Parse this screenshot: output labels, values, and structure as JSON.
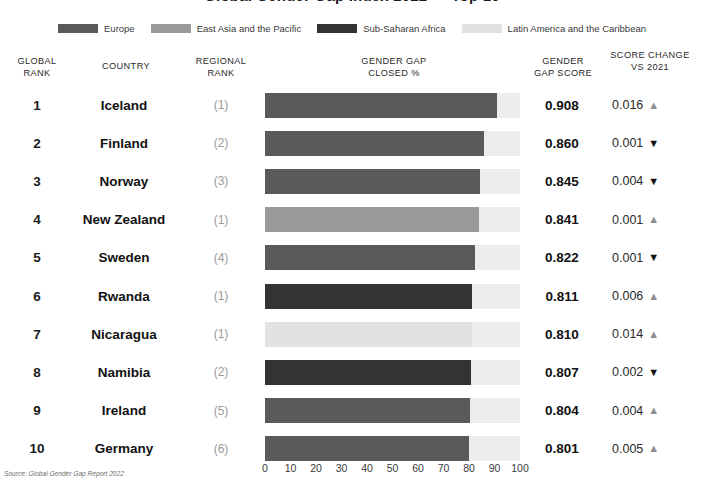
{
  "title": "Global Gender Gap Index 2022 — Top 10",
  "legend": {
    "items": [
      {
        "label": "Europe",
        "color": "#5a5a5a",
        "key": "europe"
      },
      {
        "label": "East Asia and the Pacific",
        "color": "#9a9a9a",
        "key": "east-asia-pacific"
      },
      {
        "label": "Sub-Saharan Africa",
        "color": "#333333",
        "key": "sub-saharan-africa"
      },
      {
        "label": "Latin America and the Caribbean",
        "color": "#e2e2e2",
        "key": "latin-america-caribbean"
      }
    ]
  },
  "headers": {
    "global_rank": "GLOBAL\nRANK",
    "global_rank_l1": "GLOBAL",
    "global_rank_l2": "RANK",
    "country": "COUNTRY",
    "regional_rank_l1": "REGIONAL",
    "regional_rank_l2": "RANK",
    "gender_gap_l1": "GENDER GAP",
    "gender_gap_l2": "CLOSED %",
    "gender_gap_score_l1": "GENDER",
    "gender_gap_score_l2": "GAP SCORE",
    "score_change_l1": "SCORE CHANGE",
    "score_change_l2": "VS 2021"
  },
  "axis": {
    "ticks": [
      "0",
      "10",
      "20",
      "30",
      "40",
      "50",
      "60",
      "70",
      "80",
      "90",
      "100"
    ],
    "min": 0,
    "max": 100
  },
  "source": "Source: Global Gender Gap Report 2022",
  "track_color": "#ececec",
  "rows": [
    {
      "rank": "1",
      "country": "Iceland",
      "regional_rank": "(1)",
      "score": "0.908",
      "pct": 90.8,
      "region": "europe",
      "bar_color": "#5a5a5a",
      "change": "0.016",
      "direction": "up",
      "arrow": "▲"
    },
    {
      "rank": "2",
      "country": "Finland",
      "regional_rank": "(2)",
      "score": "0.860",
      "pct": 86.0,
      "region": "europe",
      "bar_color": "#5a5a5a",
      "change": "0.001",
      "direction": "down",
      "arrow": "▼"
    },
    {
      "rank": "3",
      "country": "Norway",
      "regional_rank": "(3)",
      "score": "0.845",
      "pct": 84.5,
      "region": "europe",
      "bar_color": "#5a5a5a",
      "change": "0.004",
      "direction": "down",
      "arrow": "▼"
    },
    {
      "rank": "4",
      "country": "New Zealand",
      "regional_rank": "(1)",
      "score": "0.841",
      "pct": 84.1,
      "region": "east-asia-pacific",
      "bar_color": "#9a9a9a",
      "change": "0.001",
      "direction": "up",
      "arrow": "▲"
    },
    {
      "rank": "5",
      "country": "Sweden",
      "regional_rank": "(4)",
      "score": "0.822",
      "pct": 82.2,
      "region": "europe",
      "bar_color": "#5a5a5a",
      "change": "0.001",
      "direction": "down",
      "arrow": "▼"
    },
    {
      "rank": "6",
      "country": "Rwanda",
      "regional_rank": "(1)",
      "score": "0.811",
      "pct": 81.1,
      "region": "sub-saharan-africa",
      "bar_color": "#333333",
      "change": "0.006",
      "direction": "up",
      "arrow": "▲"
    },
    {
      "rank": "7",
      "country": "Nicaragua",
      "regional_rank": "(1)",
      "score": "0.810",
      "pct": 81.0,
      "region": "latin-america-caribbean",
      "bar_color": "#e2e2e2",
      "change": "0.014",
      "direction": "up",
      "arrow": "▲"
    },
    {
      "rank": "8",
      "country": "Namibia",
      "regional_rank": "(2)",
      "score": "0.807",
      "pct": 80.7,
      "region": "sub-saharan-africa",
      "bar_color": "#333333",
      "change": "0.002",
      "direction": "down",
      "arrow": "▼"
    },
    {
      "rank": "9",
      "country": "Ireland",
      "regional_rank": "(5)",
      "score": "0.804",
      "pct": 80.4,
      "region": "europe",
      "bar_color": "#5a5a5a",
      "change": "0.004",
      "direction": "up",
      "arrow": "▲"
    },
    {
      "rank": "10",
      "country": "Germany",
      "regional_rank": "(6)",
      "score": "0.801",
      "pct": 80.1,
      "region": "europe",
      "bar_color": "#5a5a5a",
      "change": "0.005",
      "direction": "up",
      "arrow": "▲"
    }
  ],
  "chart_data": {
    "type": "bar",
    "title": "Global Gender Gap Index 2022 — Top 10",
    "xlabel": "GENDER GAP CLOSED %",
    "ylabel": "",
    "xlim": [
      0,
      100
    ],
    "grid": false,
    "orientation": "horizontal",
    "legend_position": "top",
    "categories": [
      "Iceland",
      "Finland",
      "Norway",
      "New Zealand",
      "Sweden",
      "Rwanda",
      "Nicaragua",
      "Namibia",
      "Ireland",
      "Germany"
    ],
    "values": [
      90.8,
      86.0,
      84.5,
      84.1,
      82.2,
      81.1,
      81.0,
      80.7,
      80.4,
      80.1
    ],
    "scores": [
      0.908,
      0.86,
      0.845,
      0.841,
      0.822,
      0.811,
      0.81,
      0.807,
      0.804,
      0.801
    ],
    "global_ranks": [
      1,
      2,
      3,
      4,
      5,
      6,
      7,
      8,
      9,
      10
    ],
    "regional_ranks": [
      1,
      2,
      3,
      1,
      4,
      1,
      1,
      2,
      5,
      6
    ],
    "score_change_vs_2021": [
      0.016,
      -0.001,
      -0.004,
      0.001,
      -0.001,
      0.006,
      0.014,
      -0.002,
      0.004,
      0.005
    ],
    "regions": [
      "Europe",
      "Europe",
      "Europe",
      "East Asia and the Pacific",
      "Europe",
      "Sub-Saharan Africa",
      "Latin America and the Caribbean",
      "Sub-Saharan Africa",
      "Europe",
      "Europe"
    ],
    "tick_labels": [
      "0",
      "10",
      "20",
      "30",
      "40",
      "50",
      "60",
      "70",
      "80",
      "90",
      "100"
    ],
    "legend_entries": [
      "Europe",
      "East Asia and the Pacific",
      "Sub-Saharan Africa",
      "Latin America and the Caribbean"
    ],
    "annotation": "Source: Global Gender Gap Report 2022"
  }
}
